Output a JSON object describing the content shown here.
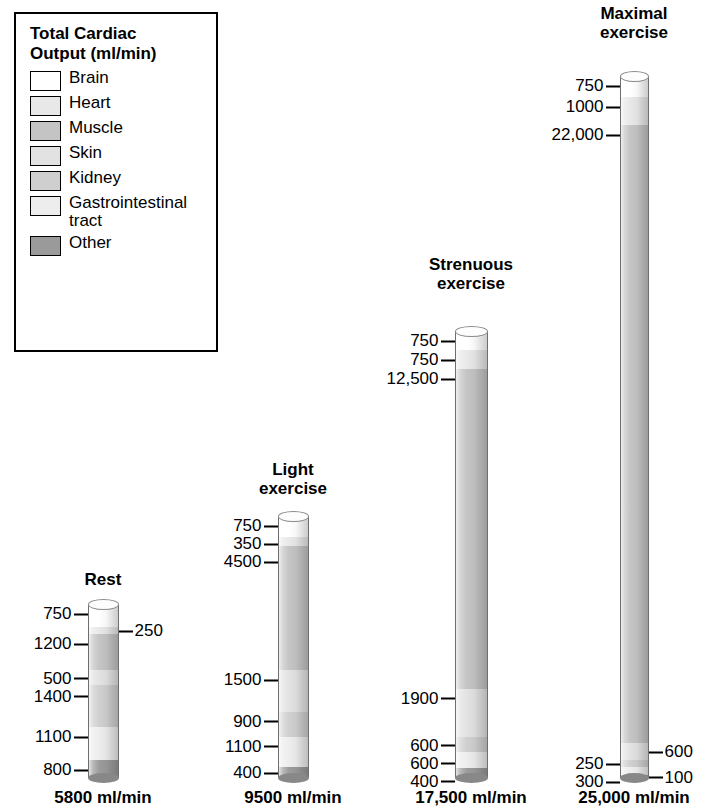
{
  "legend": {
    "title": "Total Cardiac\nOutput (ml/min)",
    "items": [
      {
        "label": "Brain",
        "color": "#ffffff"
      },
      {
        "label": "Heart",
        "color": "#e8e8e8"
      },
      {
        "label": "Muscle",
        "color": "#c4c4c4"
      },
      {
        "label": "Skin",
        "color": "#e2e2e2"
      },
      {
        "label": "Kidney",
        "color": "#cfcfcf"
      },
      {
        "label": "Gastrointestinal\ntract",
        "color": "#ededed"
      },
      {
        "label": "Other",
        "color": "#9a9a9a"
      }
    ]
  },
  "chart_data": {
    "type": "bar",
    "title": "Total Cardiac Output (ml/min)",
    "xlabel": "",
    "ylabel": "Cardiac output (ml/min)",
    "units": "ml/min",
    "categories": [
      "Brain",
      "Heart",
      "Muscle",
      "Skin",
      "Kidney",
      "Gastrointestinal tract",
      "Other"
    ],
    "columns": [
      {
        "name": "Rest",
        "title": "Rest",
        "total": 5800,
        "total_label": "5800 ml/min",
        "segments": [
          {
            "category": "Brain",
            "value": 750,
            "label": "750",
            "side": "left"
          },
          {
            "category": "Heart",
            "value": 250,
            "label": "250",
            "side": "right"
          },
          {
            "category": "Muscle",
            "value": 1200,
            "label": "1200",
            "side": "left"
          },
          {
            "category": "Skin",
            "value": 500,
            "label": "500",
            "side": "left"
          },
          {
            "category": "Kidney",
            "value": 1400,
            "label": "1400",
            "side": "left"
          },
          {
            "category": "Gastrointestinal tract",
            "value": 1100,
            "label": "1100",
            "side": "left"
          },
          {
            "category": "Other",
            "value": 800,
            "label": "800",
            "side": "left"
          }
        ]
      },
      {
        "name": "Light exercise",
        "title": "Light\nexercise",
        "total": 9500,
        "total_label": "9500 ml/min",
        "segments": [
          {
            "category": "Brain",
            "value": 750,
            "label": "750",
            "side": "left"
          },
          {
            "category": "Heart",
            "value": 350,
            "label": "350",
            "side": "left"
          },
          {
            "category": "Muscle",
            "value": 4500,
            "label": "4500",
            "side": "left"
          },
          {
            "category": "Skin",
            "value": 1500,
            "label": "1500",
            "side": "left"
          },
          {
            "category": "Kidney",
            "value": 900,
            "label": "900",
            "side": "left"
          },
          {
            "category": "Gastrointestinal tract",
            "value": 1100,
            "label": "1100",
            "side": "left"
          },
          {
            "category": "Other",
            "value": 400,
            "label": "400",
            "side": "left"
          }
        ]
      },
      {
        "name": "Strenuous exercise",
        "title": "Strenuous\nexercise",
        "total": 17500,
        "total_label": "17,500 ml/min",
        "segments": [
          {
            "category": "Brain",
            "value": 750,
            "label": "750",
            "side": "left"
          },
          {
            "category": "Heart",
            "value": 750,
            "label": "750",
            "side": "left"
          },
          {
            "category": "Muscle",
            "value": 12500,
            "label": "12,500",
            "side": "left"
          },
          {
            "category": "Skin",
            "value": 1900,
            "label": "1900",
            "side": "left"
          },
          {
            "category": "Kidney",
            "value": 600,
            "label": "600",
            "side": "left"
          },
          {
            "category": "Gastrointestinal tract",
            "value": 600,
            "label": "600",
            "side": "left"
          },
          {
            "category": "Other",
            "value": 400,
            "label": "400",
            "side": "left"
          }
        ]
      },
      {
        "name": "Maximal exercise",
        "title": "Maximal\nexercise",
        "total": 25000,
        "total_label": "25,000 ml/min",
        "segments": [
          {
            "category": "Brain",
            "value": 750,
            "label": "750",
            "side": "left"
          },
          {
            "category": "Heart",
            "value": 1000,
            "label": "1000",
            "side": "left"
          },
          {
            "category": "Muscle",
            "value": 22000,
            "label": "22,000",
            "side": "left"
          },
          {
            "category": "Skin",
            "value": 600,
            "label": "600",
            "side": "right"
          },
          {
            "category": "Kidney",
            "value": 250,
            "label": "250",
            "side": "left"
          },
          {
            "category": "Gastrointestinal tract",
            "value": 300,
            "label": "300",
            "side": "left"
          },
          {
            "category": "Other",
            "value": 100,
            "label": "100",
            "side": "right"
          }
        ]
      }
    ]
  },
  "layout": {
    "columns": [
      {
        "center": 103,
        "cyl_width": 31,
        "cyl_height": 174,
        "title_top": 570
      },
      {
        "center": 293,
        "cyl_width": 31,
        "cyl_height": 262,
        "title_top": 460
      },
      {
        "center": 471,
        "cyl_width": 33,
        "cyl_height": 447,
        "title_top": 255
      },
      {
        "center": 634,
        "cyl_width": 29,
        "cyl_height": 702,
        "title_top": 4
      }
    ]
  }
}
